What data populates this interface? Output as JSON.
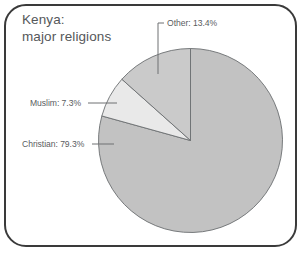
{
  "figure": {
    "border_color": "#3a3a3a",
    "background": "#ffffff"
  },
  "title": {
    "line1": "Kenya:",
    "line2": "major religions",
    "color": "#55585a"
  },
  "chart_data": {
    "type": "pie",
    "title": "Kenya: major religions",
    "subtitle": "",
    "xlabel": "",
    "ylabel": "",
    "categories": [
      "Christian",
      "Muslim",
      "Other"
    ],
    "values": [
      79.3,
      7.3,
      13.4
    ],
    "unit": "%",
    "labels": [
      "Christian: 79.3%",
      "Muslim: 7.3%",
      "Other: 13.4%"
    ],
    "colors": [
      "#c2c2c2",
      "#e9e9e9",
      "#cacaca"
    ],
    "slice_outline_color": "#6b6e70",
    "start_angle_deg": 0,
    "direction": "clockwise",
    "legend": "none",
    "grid": false,
    "annotations": [
      {
        "name": "other",
        "text": "Other: 13.4%",
        "leader": true
      },
      {
        "name": "muslim",
        "text": "Muslim: 7.3%",
        "leader": true
      },
      {
        "name": "christian",
        "text": "Christian: 79.3%",
        "leader": true
      }
    ]
  },
  "callouts": {
    "other": "Other: 13.4%",
    "muslim": "Muslim: 7.3%",
    "christian": "Christian: 79.3%"
  }
}
